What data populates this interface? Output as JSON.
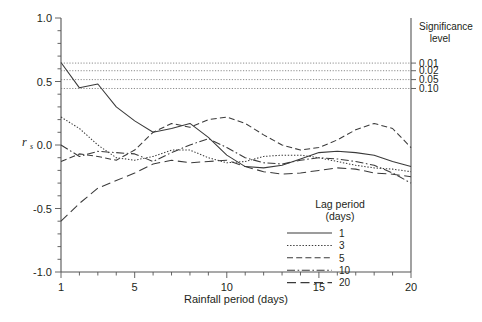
{
  "chart_data": {
    "type": "line",
    "title": "",
    "xlabel": "Rainfall period (days)",
    "ylabel": "rs",
    "ylabel_main": "r",
    "ylabel_sub": "s",
    "xlim": [
      1,
      20
    ],
    "ylim": [
      -1.0,
      1.0
    ],
    "grid": false,
    "legend_position": "bottom-right",
    "xticks": [
      1,
      5,
      10,
      15,
      20
    ],
    "xtick_labels": [
      "1",
      "5",
      "10",
      "15",
      "20"
    ],
    "xminor_step": 1,
    "yticks": [
      -1.0,
      -0.5,
      0.0,
      0.5,
      1.0
    ],
    "ytick_labels": [
      "-1.0",
      "-0.5",
      "0.0",
      "0.5",
      "1.0"
    ],
    "yminor_step": 0.1,
    "x": [
      1,
      2,
      3,
      4,
      5,
      6,
      7,
      8,
      9,
      10,
      11,
      12,
      13,
      14,
      15,
      16,
      17,
      18,
      19,
      20
    ],
    "series": [
      {
        "name": "1",
        "lag_days": 1,
        "style": "solid",
        "values": [
          0.65,
          0.45,
          0.48,
          0.3,
          0.19,
          0.1,
          0.13,
          0.17,
          0.06,
          -0.08,
          -0.17,
          -0.18,
          -0.16,
          -0.11,
          -0.06,
          -0.05,
          -0.06,
          -0.08,
          -0.13,
          -0.17
        ]
      },
      {
        "name": "3",
        "lag_days": 3,
        "style": "dotted",
        "values": [
          0.22,
          0.13,
          0.0,
          -0.1,
          -0.12,
          -0.09,
          -0.04,
          -0.04,
          -0.1,
          -0.14,
          -0.13,
          -0.09,
          -0.08,
          -0.08,
          -0.1,
          -0.13,
          -0.16,
          -0.18,
          -0.19,
          -0.21
        ]
      },
      {
        "name": "5",
        "lag_days": 5,
        "style": "dashed",
        "values": [
          -0.13,
          -0.07,
          -0.09,
          -0.12,
          -0.04,
          0.1,
          0.17,
          0.14,
          0.2,
          0.22,
          0.17,
          0.08,
          0.0,
          -0.04,
          -0.02,
          0.04,
          0.12,
          0.17,
          0.13,
          -0.02
        ]
      },
      {
        "name": "10",
        "lag_days": 10,
        "style": "dashdot",
        "values": [
          0.0,
          -0.09,
          -0.05,
          -0.06,
          -0.07,
          -0.13,
          -0.06,
          0.0,
          0.05,
          -0.02,
          -0.1,
          -0.14,
          -0.15,
          -0.12,
          -0.1,
          -0.11,
          -0.13,
          -0.16,
          -0.22,
          -0.3
        ]
      },
      {
        "name": "20",
        "lag_days": 20,
        "style": "longdash",
        "values": [
          -0.6,
          -0.46,
          -0.34,
          -0.28,
          -0.22,
          -0.15,
          -0.12,
          -0.14,
          -0.13,
          -0.12,
          -0.17,
          -0.21,
          -0.23,
          -0.22,
          -0.2,
          -0.18,
          -0.19,
          -0.22,
          -0.23,
          -0.25
        ]
      }
    ],
    "significance_lines": {
      "label_title_line1": "Significance",
      "label_title_line2": "level",
      "levels": [
        {
          "label": "0.01",
          "value": 0.645
        },
        {
          "label": "0.02",
          "value": 0.585
        },
        {
          "label": "0.05",
          "value": 0.515
        },
        {
          "label": "0.10",
          "value": 0.445
        }
      ]
    },
    "legend": {
      "title_line1": "Lag period",
      "title_line2": "(days)",
      "entries": [
        {
          "label": "1",
          "style": "solid"
        },
        {
          "label": "3",
          "style": "dotted"
        },
        {
          "label": "5",
          "style": "dashed"
        },
        {
          "label": "10",
          "style": "dashdot"
        },
        {
          "label": "20",
          "style": "longdash"
        }
      ]
    },
    "colors": {
      "line": "#3a3a3a",
      "axis": "#555555",
      "significance": "#6e6e6e",
      "text": "#231f20",
      "background": "#ffffff"
    }
  }
}
